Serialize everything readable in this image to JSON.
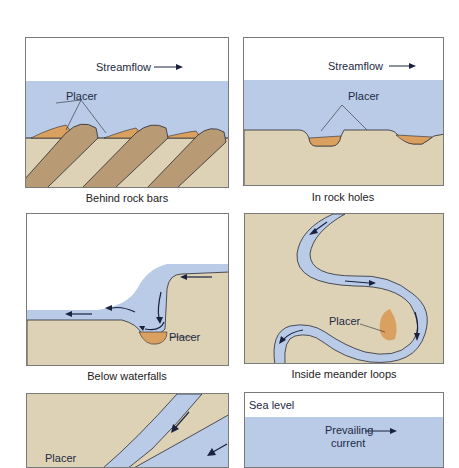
{
  "figure": {
    "colors": {
      "water": "#b9cbe6",
      "rock": "#ddd2b6",
      "rock_dark": "#b89b74",
      "placer": "#d9a060",
      "outline": "#2a2a33",
      "arrow": "#1a2240"
    },
    "panels": [
      {
        "id": "behind-rock-bars",
        "caption": "Behind rock bars",
        "labels": {
          "flow": "Streamflow",
          "placer": "Placer"
        }
      },
      {
        "id": "in-rock-holes",
        "caption": "In rock holes",
        "labels": {
          "flow": "Streamflow",
          "placer": "Placer"
        }
      },
      {
        "id": "below-waterfalls",
        "caption": "Below waterfalls",
        "labels": {
          "placer": "Placer"
        }
      },
      {
        "id": "inside-meander-loops",
        "caption": "Inside meander loops",
        "labels": {
          "placer": "Placer"
        }
      },
      {
        "id": "tributary-junction",
        "caption": "",
        "labels": {
          "placer": "Placer"
        }
      },
      {
        "id": "coastal",
        "caption": "",
        "labels": {
          "sea_level": "Sea level",
          "current_1": "Prevailing",
          "current_2": "current"
        }
      }
    ]
  }
}
